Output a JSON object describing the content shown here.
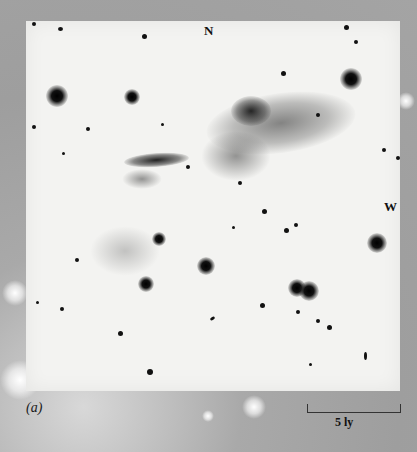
{
  "figure": {
    "panel_label": "(a)",
    "compass": {
      "north": "N",
      "west": "W"
    },
    "scale_bar": {
      "label": "5 ly"
    }
  },
  "colors": {
    "border_gray": "#a4a4a4",
    "plate_background": "#f3f3f1",
    "stars": "#111111"
  }
}
